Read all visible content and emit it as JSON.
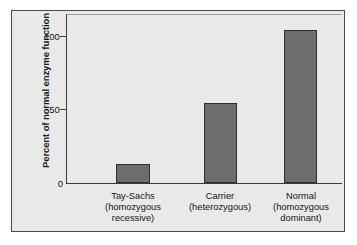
{
  "chart_data": {
    "type": "bar",
    "title": "",
    "xlabel": "",
    "ylabel": "Percent of normal enzyme function",
    "ylim": [
      0,
      115
    ],
    "yticks": [
      0,
      50,
      100
    ],
    "ytick_labels": [
      "0",
      "50",
      "100"
    ],
    "grid": false,
    "legend": false,
    "categories": [
      "Tay-Sachs (homozygous recessive)",
      "Carrier (heterozygous)",
      "Normal (homozygous dominant)"
    ],
    "category_lines": [
      [
        "Tay-Sachs",
        "(homozygous",
        "recessive)"
      ],
      [
        "Carrier",
        "(heterozygous)"
      ],
      [
        "Normal",
        "(homozygous",
        "dominant)"
      ]
    ],
    "values": [
      13,
      55,
      105
    ],
    "bar_color": "#6d6d6d",
    "bar_edge_color": "#2e2e2e",
    "panel_color": "#e9e9e9",
    "frame_color": "#4a4a4a",
    "axis_color": "#3c3c3c",
    "text_color": "#141414"
  }
}
